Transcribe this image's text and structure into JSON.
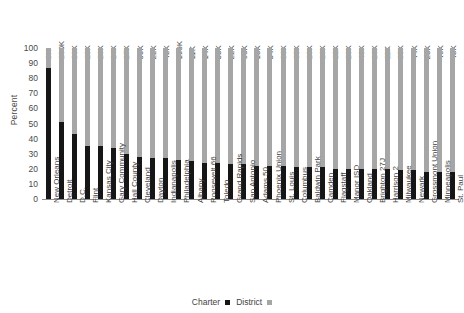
{
  "chart_data": {
    "type": "bar",
    "subtype": "stacked-100-percent",
    "title": "",
    "xlabel": "",
    "ylabel": "Percent",
    "ylim": [
      0,
      100
    ],
    "yticks": [
      100,
      90,
      80,
      70,
      60,
      50,
      40,
      30,
      20,
      10,
      0
    ],
    "grid": false,
    "legend_position": "bottom-center",
    "categories": [
      "New Orleans",
      "Detroit",
      "D.C.",
      "Flint",
      "Kansas City",
      "Gary Community",
      "Hall County",
      "Cleveland",
      "Dayton",
      "Indianapolis",
      "Philadelphia",
      "Albany",
      "Roosevelt 66",
      "Toledo",
      "Grand Rapids",
      "San Antonio",
      "Adams 50",
      "Phoenix Union",
      "St. Louis",
      "Columbus",
      "Baldwin Park",
      "Camden",
      "Flagstaff",
      "Manor ISD",
      "Oakland",
      "Brighton 27J",
      "Harrison 2",
      "Milwaukee",
      "Newark",
      "Grossmont Union",
      "Minneapolis",
      "St. Paul"
    ],
    "top_labels": [
      "3K",
      "100K",
      "80K",
      "13K",
      "26K",
      "14K",
      "27K",
      "59K",
      "22K",
      "42K",
      "199K",
      "11K",
      "14K",
      "33K",
      "22K",
      "60K",
      "13K",
      "34K",
      "36K",
      "65K",
      "19K",
      "16K",
      "12K",
      "10K",
      "48K",
      "16K",
      "11K",
      "85K",
      "44K",
      "23K",
      "46K",
      "48K"
    ],
    "series": [
      {
        "name": "Charter",
        "color": "#161616",
        "values": [
          87,
          51,
          43,
          35,
          35,
          34,
          30,
          28,
          27,
          27,
          26,
          25,
          24,
          24,
          23,
          23,
          22,
          22,
          22,
          21,
          21,
          21,
          20,
          20,
          20,
          20,
          20,
          19,
          19,
          18,
          18,
          18
        ]
      },
      {
        "name": "District",
        "color": "#a6a6a6",
        "values": [
          13,
          49,
          57,
          65,
          65,
          66,
          70,
          72,
          73,
          73,
          74,
          75,
          76,
          76,
          77,
          77,
          78,
          78,
          78,
          79,
          79,
          79,
          80,
          80,
          80,
          80,
          80,
          81,
          81,
          82,
          82,
          82
        ]
      }
    ]
  },
  "legend": {
    "items": [
      {
        "label": "Charter"
      },
      {
        "label": "District"
      }
    ]
  },
  "axis": {
    "y_title": "Percent"
  }
}
